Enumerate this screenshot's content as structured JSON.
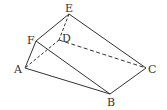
{
  "diagram": {
    "type": "geometric-solid",
    "line_color": "#333333",
    "vertices": {
      "A": {
        "label": "A",
        "x": 25,
        "y": 68,
        "lx": 14,
        "ly": 72
      },
      "B": {
        "label": "B",
        "x": 110,
        "y": 94,
        "lx": 107,
        "ly": 106
      },
      "C": {
        "label": "C",
        "x": 146,
        "y": 68,
        "lx": 148,
        "ly": 72
      },
      "D": {
        "label": "D",
        "x": 59,
        "y": 40,
        "lx": 62,
        "ly": 41
      },
      "E": {
        "label": "E",
        "x": 69,
        "y": 14,
        "lx": 65,
        "ly": 12
      },
      "F": {
        "label": "F",
        "x": 36,
        "y": 41,
        "lx": 27,
        "ly": 42
      }
    },
    "solid_edges": [
      [
        "E",
        "F"
      ],
      [
        "F",
        "A"
      ],
      [
        "A",
        "B"
      ],
      [
        "F",
        "B"
      ],
      [
        "E",
        "C"
      ],
      [
        "C",
        "B"
      ]
    ],
    "dashed_edges": [
      [
        "E",
        "D"
      ],
      [
        "D",
        "A"
      ],
      [
        "D",
        "C"
      ]
    ]
  }
}
